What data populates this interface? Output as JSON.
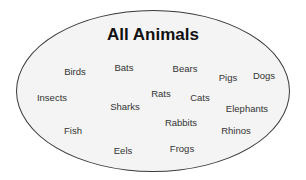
{
  "diagram": {
    "type": "set-ellipse",
    "title": "All Animals",
    "colors": {
      "fill": "#f4f4f4",
      "stroke": "#3a3a3a",
      "text": "#333333",
      "title": "#111111"
    },
    "items": [
      {
        "label": "Birds",
        "x": 75,
        "y": 71
      },
      {
        "label": "Bats",
        "x": 124,
        "y": 67
      },
      {
        "label": "Bears",
        "x": 185,
        "y": 68
      },
      {
        "label": "Pigs",
        "x": 228,
        "y": 77
      },
      {
        "label": "Dogs",
        "x": 264,
        "y": 75
      },
      {
        "label": "Insects",
        "x": 52,
        "y": 97
      },
      {
        "label": "Sharks",
        "x": 125,
        "y": 106
      },
      {
        "label": "Rats",
        "x": 161,
        "y": 93
      },
      {
        "label": "Cats",
        "x": 200,
        "y": 97
      },
      {
        "label": "Elephants",
        "x": 247,
        "y": 108
      },
      {
        "label": "Fish",
        "x": 73,
        "y": 130
      },
      {
        "label": "Rabbits",
        "x": 181,
        "y": 122
      },
      {
        "label": "Rhinos",
        "x": 236,
        "y": 130
      },
      {
        "label": "Eels",
        "x": 123,
        "y": 150
      },
      {
        "label": "Frogs",
        "x": 182,
        "y": 148
      }
    ]
  }
}
